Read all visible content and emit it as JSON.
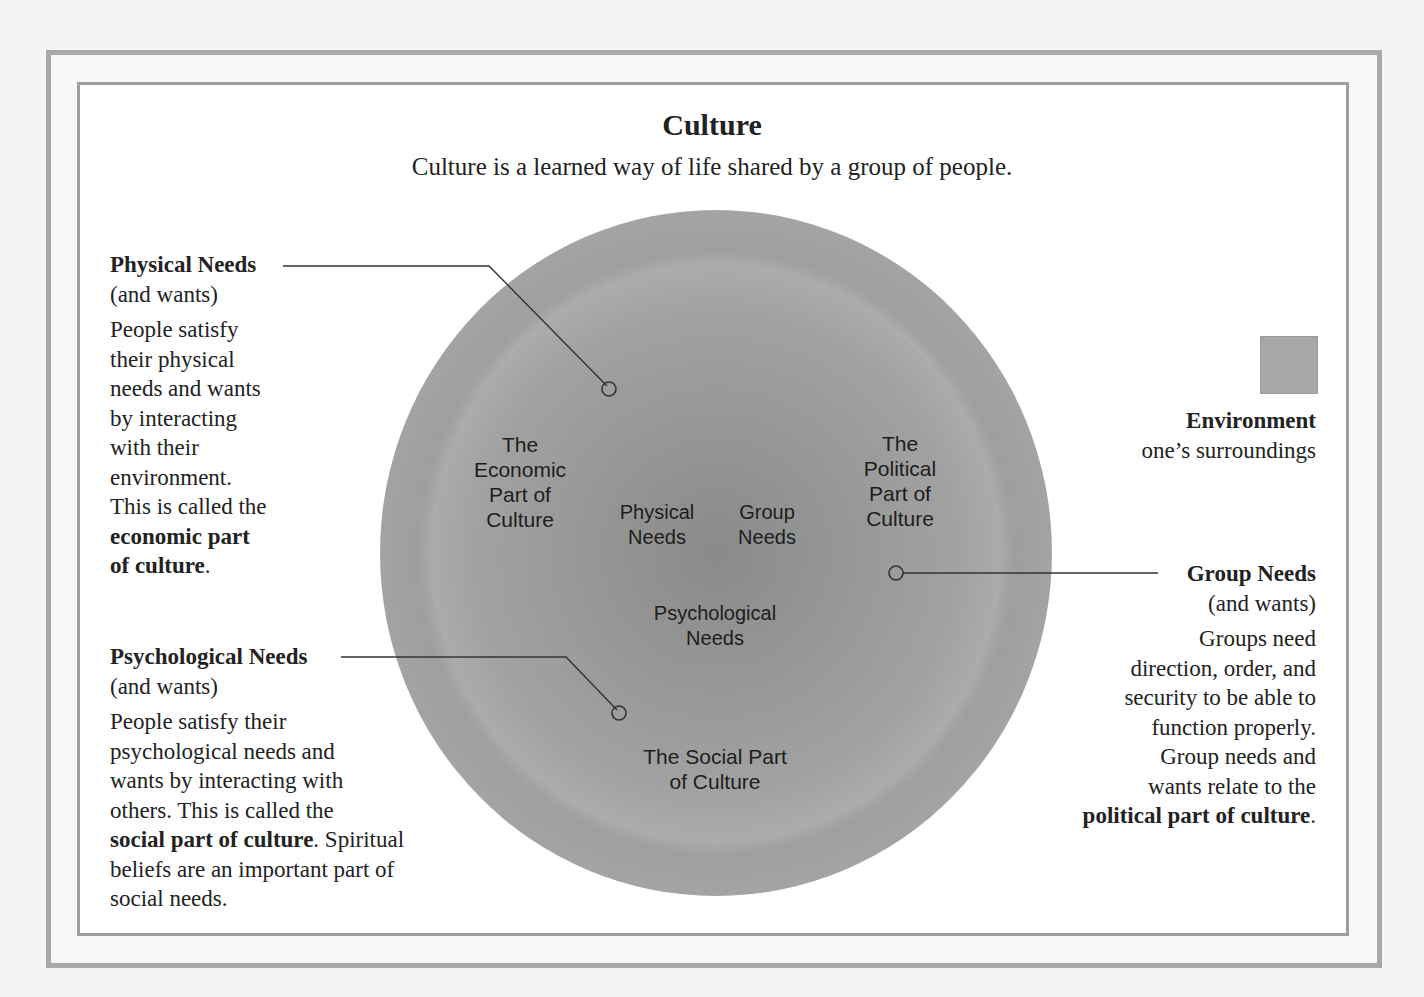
{
  "header": {
    "title": "Culture",
    "subtitle": "Culture is a learned way of life shared by a group of people."
  },
  "circle_labels": {
    "economic": [
      "The",
      "Economic",
      "Part of",
      "Culture"
    ],
    "political": [
      "The",
      "Political",
      "Part of",
      "Culture"
    ],
    "physical_needs": [
      "Physical",
      "Needs"
    ],
    "group_needs": [
      "Group",
      "Needs"
    ],
    "psychological_needs": [
      "Psychological",
      "Needs"
    ],
    "social": [
      "The Social Part",
      "of Culture"
    ]
  },
  "physical_needs": {
    "heading": "Physical Needs",
    "sub": "(and wants)",
    "lines": [
      "People satisfy",
      "their physical",
      "needs and wants",
      "by interacting",
      "with their",
      "environment.",
      "This is called the"
    ],
    "bold_lines": [
      "economic part",
      "of culture"
    ],
    "end": "."
  },
  "psychological_needs": {
    "heading": "Psychological Needs",
    "sub": "(and wants)",
    "lines": [
      "People satisfy their",
      "psychological needs and",
      "wants by interacting with",
      "others. This is called the"
    ],
    "bold": "social part of culture",
    "after_bold": ". Spiritual",
    "tail": [
      "beliefs are an important part of",
      "social needs."
    ]
  },
  "environment": {
    "heading": "Environment",
    "sub": "one’s surroundings"
  },
  "group_needs": {
    "heading": "Group Needs",
    "sub": "(and wants)",
    "lines": [
      "Groups need",
      "direction, order, and",
      "security to be able to",
      "function properly.",
      "Group needs and",
      "wants relate to the"
    ],
    "bold": "political part of culture",
    "end": "."
  }
}
